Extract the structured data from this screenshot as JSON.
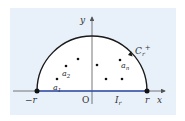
{
  "diagram": {
    "type": "contour-semicircle",
    "axes": {
      "x_label": "x",
      "y_label": "y",
      "origin_label": "O"
    },
    "contour": {
      "label_main": "C",
      "label_sub": "r",
      "label_sup": "+"
    },
    "segment": {
      "label_main": "I",
      "label_sub": "r"
    },
    "endpoints": {
      "left": "−r",
      "right": "r"
    },
    "points": [
      {
        "label_main": "a",
        "label_sub": "1"
      },
      {
        "label_main": "a",
        "label_sub": "2"
      },
      {
        "label_main": "a",
        "label_sub": "n"
      }
    ],
    "colors": {
      "panel": "#e8f1fa",
      "region": "#ffffff",
      "arc": "#1a1a1a",
      "segment": "#3a55b4",
      "axis": "#555555"
    }
  }
}
